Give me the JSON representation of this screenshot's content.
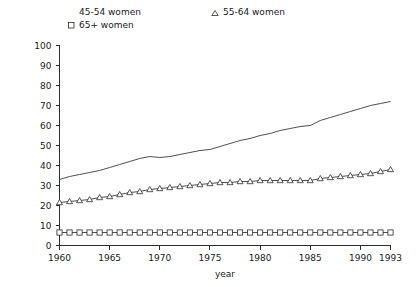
{
  "chart_data": {
    "type": "line",
    "title": "",
    "xlabel": "year",
    "ylabel": "",
    "xlim": [
      1960,
      1993
    ],
    "ylim": [
      0,
      100
    ],
    "grid": false,
    "legend_position": "top",
    "x_ticks": [
      "1960",
      "1965",
      "1970",
      "1975",
      "1980",
      "1985",
      "1990",
      "1993"
    ],
    "x_tick_values": [
      1960,
      1965,
      1970,
      1975,
      1980,
      1985,
      1990,
      1993
    ],
    "y_ticks": [
      "0",
      "10",
      "20",
      "30",
      "40",
      "50",
      "60",
      "70",
      "80",
      "90",
      "100"
    ],
    "y_tick_values": [
      0,
      10,
      20,
      30,
      40,
      50,
      60,
      70,
      80,
      90,
      100
    ],
    "x": [
      1960,
      1961,
      1962,
      1963,
      1964,
      1965,
      1966,
      1967,
      1968,
      1969,
      1970,
      1971,
      1972,
      1973,
      1974,
      1975,
      1976,
      1977,
      1978,
      1979,
      1980,
      1981,
      1982,
      1983,
      1984,
      1985,
      1986,
      1987,
      1988,
      1989,
      1990,
      1991,
      1992,
      1993
    ],
    "series": [
      {
        "name": "45-54 women",
        "marker": "none",
        "values": [
          33.0,
          34.5,
          35.5,
          36.5,
          37.5,
          39.0,
          40.5,
          42.0,
          43.5,
          44.5,
          44.0,
          44.5,
          45.5,
          46.5,
          47.5,
          48.0,
          49.5,
          51.0,
          52.5,
          53.5,
          55.0,
          56.0,
          57.5,
          58.5,
          59.5,
          60.0,
          62.5,
          64.0,
          65.5,
          67.0,
          68.5,
          70.0,
          71.0,
          72.0
        ]
      },
      {
        "name": "55-64 women",
        "marker": "triangle",
        "values": [
          21.5,
          22.0,
          22.5,
          23.0,
          24.0,
          24.5,
          25.5,
          26.5,
          27.0,
          28.0,
          28.5,
          29.0,
          29.5,
          30.0,
          30.5,
          31.0,
          31.5,
          31.5,
          32.0,
          32.0,
          32.5,
          32.5,
          32.5,
          32.5,
          32.5,
          32.5,
          33.5,
          34.0,
          34.5,
          35.0,
          35.5,
          36.0,
          37.0,
          38.0
        ]
      },
      {
        "name": "65+ women",
        "marker": "square",
        "values": [
          6.5,
          6.5,
          6.5,
          6.5,
          6.5,
          6.5,
          6.5,
          6.5,
          6.5,
          6.5,
          6.5,
          6.5,
          6.5,
          6.5,
          6.5,
          6.5,
          6.5,
          6.5,
          6.5,
          6.5,
          6.5,
          6.5,
          6.5,
          6.5,
          6.5,
          6.5,
          6.5,
          6.5,
          6.5,
          6.5,
          6.5,
          6.5,
          6.5,
          6.5
        ]
      }
    ]
  },
  "legend": {
    "entries": [
      {
        "label": "45-54 women",
        "marker": "none"
      },
      {
        "label": "55-64 women",
        "marker": "triangle"
      },
      {
        "label": "65+ women",
        "marker": "square"
      }
    ]
  },
  "colors": {
    "line": "#3a3a3a",
    "axis": "#2b2b2b",
    "text": "#1a1a1a",
    "background": "#ffffff",
    "marker_fill": "#ffffff"
  }
}
